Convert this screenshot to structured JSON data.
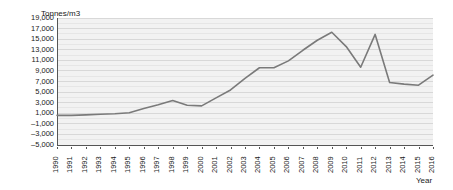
{
  "chart_data": {
    "type": "line",
    "title": "",
    "ylabel": "Tonnes/m3",
    "xlabel": "Year",
    "grid": true,
    "legend": "none",
    "ylim": [
      -5000,
      19000
    ],
    "ytick_step": 2000,
    "categories": [
      "1990",
      "1991",
      "1992",
      "1993",
      "1994",
      "1995",
      "1996",
      "1997",
      "1998",
      "1999",
      "2000",
      "2001",
      "2002",
      "2003",
      "2004",
      "2005",
      "2006",
      "2007",
      "2008",
      "2009",
      "2010",
      "2011",
      "2012",
      "2013",
      "2014",
      "2015",
      "2016"
    ],
    "ytick_labels": [
      "19,000",
      "17,000",
      "15,000",
      "13,000",
      "11,000",
      "9,000",
      "7,000",
      "5,000",
      "3,000",
      "1,000",
      "–1,000",
      "–3,000",
      "–5,000"
    ],
    "ytick_values": [
      19000,
      17000,
      15000,
      13000,
      11000,
      9000,
      7000,
      5000,
      3000,
      1000,
      -1000,
      -3000,
      -5000
    ],
    "series": [
      {
        "name": "Tonnes/m3",
        "color": "#7a7a7a",
        "values": [
          600,
          600,
          700,
          800,
          900,
          1100,
          1900,
          2600,
          3400,
          2500,
          2400,
          3900,
          5400,
          7600,
          9600,
          9600,
          10900,
          12900,
          14800,
          16300,
          13600,
          9700,
          15900,
          6800,
          6500,
          6300,
          8200
        ]
      }
    ]
  },
  "colors": {
    "plot_background": "#f2f2f2",
    "gridline": "#d8d8d8",
    "axis": "#555555",
    "text": "#1a1a1a",
    "series": "#7a7a7a"
  }
}
